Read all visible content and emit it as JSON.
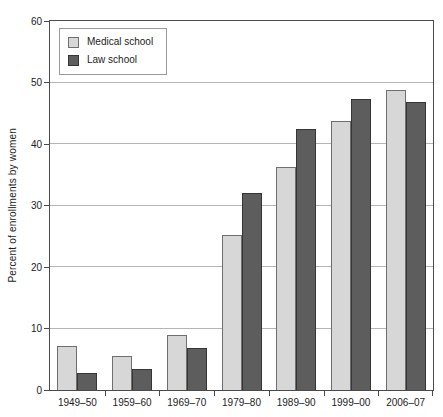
{
  "chart_data": {
    "type": "bar",
    "title": "",
    "xlabel": "",
    "ylabel": "Percent of enrollments by women",
    "ylim": [
      0,
      60
    ],
    "yticks": [
      0,
      10,
      20,
      30,
      40,
      50,
      60
    ],
    "grid": true,
    "frame": "box",
    "legend_position": "top-left-inside",
    "categories": [
      "1949–50",
      "1959–60",
      "1969–70",
      "1979–80",
      "1989–90",
      "1999–00",
      "2006–07"
    ],
    "series": [
      {
        "name": "Medical school",
        "fill_color": "#d7d7d7",
        "border_color": "#6f6f6f",
        "values": [
          7.2,
          5.6,
          9.0,
          25.2,
          36.2,
          43.8,
          48.8
        ]
      },
      {
        "name": "Law school",
        "fill_color": "#5d5d5d",
        "border_color": "#353535",
        "values": [
          2.8,
          3.4,
          6.9,
          32.0,
          42.5,
          47.3,
          46.8
        ]
      }
    ]
  },
  "style_colors": {
    "axis_frame": "#4a4a4a",
    "gridline": "#b5b5b5",
    "text": "#1c1c1c",
    "legend_border": "#9a9a9a",
    "background": "#ffffff"
  }
}
